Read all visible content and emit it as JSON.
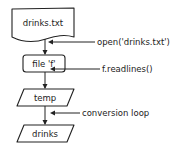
{
  "diagram": {
    "type": "flowchart",
    "style": "hand-drawn",
    "colors": {
      "stroke": "#222222",
      "background": "#ffffff"
    },
    "nodes": [
      {
        "id": "file",
        "shape": "document",
        "label": "drinks.txt"
      },
      {
        "id": "f",
        "shape": "rounded-rectangle",
        "label": "file 'f'"
      },
      {
        "id": "temp",
        "shape": "parallelogram",
        "label": "temp"
      },
      {
        "id": "drinks",
        "shape": "parallelogram",
        "label": "drinks"
      }
    ],
    "edges": [
      {
        "from": "file",
        "to": "f",
        "label": "open('drinks.txt')"
      },
      {
        "from": "f",
        "to": "temp",
        "label": "f.readlines()"
      },
      {
        "from": "temp",
        "to": "drinks",
        "label": "conversion loop"
      }
    ]
  }
}
